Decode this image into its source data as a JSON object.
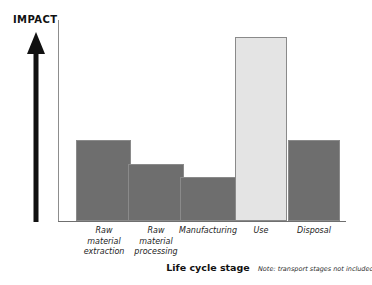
{
  "chart_data": {
    "type": "bar",
    "title": "",
    "subtitle": "",
    "xlabel": "Life cycle stage",
    "ylabel": "IMPACT",
    "categories": [
      "Raw material extraction",
      "Raw material processing",
      "Manufacturing",
      "Use",
      "Disposal"
    ],
    "category_lines": [
      [
        "Raw",
        "material",
        "extraction"
      ],
      [
        "Raw",
        "material",
        "processing"
      ],
      [
        "Manufacturing"
      ],
      [
        "Use"
      ],
      [
        "Disposal"
      ]
    ],
    "values": [
      44,
      31,
      24,
      100,
      44
    ],
    "ylim": [
      0,
      109
    ],
    "grid": false,
    "legend": null,
    "annotations": [
      "Note: transport stages not included"
    ],
    "bar_colors": [
      "#6e6e6e",
      "#6e6e6e",
      "#6e6e6e",
      "#e4e4e4",
      "#6e6e6e"
    ],
    "bar_border_color": "#8a8a8a",
    "axis_color": "#6f6f6f",
    "arrow_color": "#111111"
  },
  "labels": {
    "y_axis_label": "IMPACT",
    "x_axis_title": "Life cycle stage",
    "footnote": "Note: transport stages not included",
    "cat_0": "Raw\nmaterial\nextraction",
    "cat_1": "Raw\nmaterial\nprocessing",
    "cat_2": "Manufacturing",
    "cat_3": "Use",
    "cat_4": "Disposal"
  }
}
